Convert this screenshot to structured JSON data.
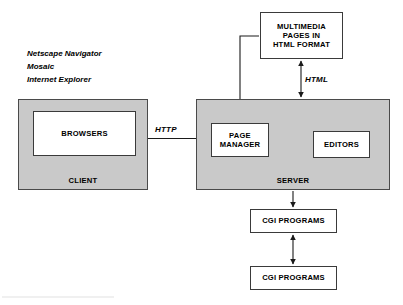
{
  "diagram": {
    "background_color": "#ffffff",
    "zone_fill_color": "#c9c9c9",
    "box_fill_color": "#ffffff",
    "line_color": "#1a1a1a"
  },
  "client": {
    "zone_label": "CLIENT",
    "inner_box_label": "BROWSERS",
    "browser_examples": [
      "Netscape Navigator",
      "Mosaic",
      "Internet Explorer"
    ]
  },
  "server": {
    "zone_label": "SERVER",
    "page_manager_label": "PAGE\nMANAGER",
    "page_manager_line_1": "PAGE",
    "page_manager_line_2": "MANAGER",
    "editors_label": "EDITORS"
  },
  "storage": {
    "multimedia_line_1": "MULTIMEDIA",
    "multimedia_line_2": "PAGES IN",
    "multimedia_line_3": "HTML FORMAT"
  },
  "programs": {
    "cgi_1_label": "CGI PROGRAMS",
    "cgi_2_label": "CGI PROGRAMS"
  },
  "connections": {
    "http_label": "HTTP",
    "html_label": "HTML",
    "edges": [
      {
        "name": "client-server-http",
        "from": "BROWSERS",
        "to": "PAGE MANAGER",
        "label": "HTTP",
        "direction": "bidirectional"
      },
      {
        "name": "multimedia-html",
        "from": "MULTIMEDIA PAGES IN HTML FORMAT",
        "to": "SERVER",
        "label": "HTML",
        "direction": "bidirectional"
      },
      {
        "name": "pagemanager-multimedia",
        "from": "PAGE MANAGER",
        "to": "MULTIMEDIA PAGES IN HTML FORMAT",
        "label": "",
        "direction": "none"
      },
      {
        "name": "server-cgi",
        "from": "SERVER",
        "to": "CGI PROGRAMS",
        "label": "",
        "direction": "down"
      },
      {
        "name": "cgi-cgi",
        "from": "CGI PROGRAMS",
        "to": "CGI PROGRAMS",
        "label": "",
        "direction": "bidirectional"
      }
    ]
  }
}
